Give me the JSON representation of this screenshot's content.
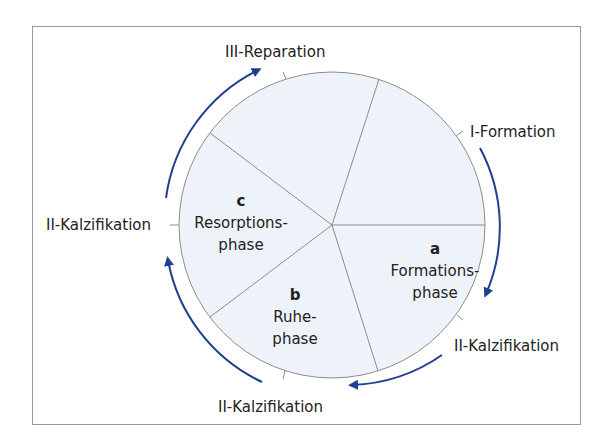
{
  "diagram": {
    "type": "cycle",
    "colors": {
      "fill": "#eef2f9",
      "stroke": "#8c8c8c",
      "arrow": "#1f3f8f",
      "frame": "#9a9a9a"
    },
    "segments": [
      {
        "letter": "a",
        "line1": "Formations-",
        "line2": "phase"
      },
      {
        "letter": "b",
        "line1": "Ruhe-",
        "line2": "phase"
      },
      {
        "letter": "c",
        "line1": "Resorptions-",
        "line2": "phase"
      }
    ],
    "labels": {
      "top": "III-Reparation",
      "top_right": "I-Formation",
      "bottom_right": "II-Kalzifikation",
      "bottom": "II-Kalzifikation",
      "left": "II-Kalzifikation"
    }
  }
}
